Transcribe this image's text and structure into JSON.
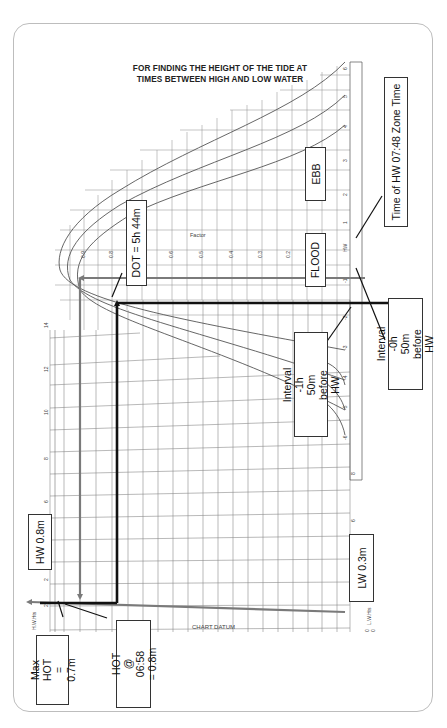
{
  "title": {
    "line1": "FOR FINDING THE HEIGHT OF THE TIDE AT",
    "line2": "TIMES BETWEEN HIGH AND LOW WATER"
  },
  "annotations": {
    "ebb": "EBB",
    "flood": "FLOOD",
    "dot": "DOT = 5h 44m",
    "time_hw": "Time of HW 07:48 Zone Time",
    "interval_0h50": "Interval -0h 50m before HW",
    "interval_1h50": "Interval -1h 50m before HW",
    "hw_height": "HW 0.8m",
    "lw_height": "LW 0.3m",
    "max_hot": "Max HOT = 0.7m",
    "hot": "HOT @ 06:58 = 0.8m",
    "chart_datum": "CHART DATUM",
    "factor": "Factor"
  },
  "axes": {
    "factor_ticks": [
      "0.9",
      "0.8",
      "0.6",
      "0.5",
      "0.4",
      "0.3",
      "0.2"
    ],
    "hour_ticks": [
      "-6",
      "-5",
      "-4",
      "-3",
      "-2",
      "-1",
      "HW",
      "+1",
      "+2",
      "+3",
      "+4",
      "+5",
      "+6"
    ],
    "height_ticks_left": [
      "2",
      "4",
      "6",
      "8",
      "10",
      "12",
      "14"
    ],
    "height_ticks_right": [
      "1",
      "2",
      "3",
      "4",
      "5",
      "6",
      "7"
    ],
    "hw_hts_label": "H.W.Hts",
    "lw_hts_label": "L.W.Hts",
    "zero_labels": [
      "0",
      "0"
    ]
  },
  "colors": {
    "grid": "#777777",
    "curve": "#555555",
    "thick_line": "#111111",
    "gray_line": "#7a7a7a",
    "border": "#bdbdbd"
  }
}
